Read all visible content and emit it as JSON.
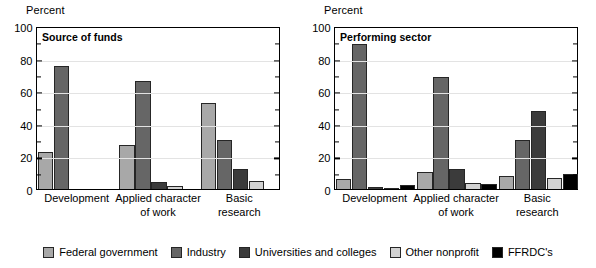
{
  "chart_data": [
    {
      "type": "bar",
      "title": "Source of funds",
      "ylabel": "Percent",
      "xlabel": "",
      "ylim": [
        0,
        100
      ],
      "yticks": [
        0,
        20,
        40,
        60,
        80,
        100
      ],
      "grid": true,
      "legend_position": "bottom",
      "categories": [
        "Development",
        "Applied character\nof work",
        "Basic\nresearch"
      ],
      "series": [
        {
          "name": "Federal government",
          "color": "#a8a8a8",
          "values": [
            23,
            27,
            53
          ]
        },
        {
          "name": "Industry",
          "color": "#666666",
          "values": [
            75.5,
            66,
            30
          ]
        },
        {
          "name": "Universities and colleges",
          "color": "#3b3b3b",
          "values": [
            0,
            4,
            12
          ]
        },
        {
          "name": "Other nonprofit",
          "color": "#d2d2d2",
          "values": [
            0,
            2,
            5
          ]
        },
        {
          "name": "FFRDC's",
          "color": "#000000",
          "values": [
            0,
            0,
            0
          ]
        }
      ]
    },
    {
      "type": "bar",
      "title": "Performing sector",
      "ylabel": "Percent",
      "xlabel": "",
      "ylim": [
        0,
        100
      ],
      "yticks": [
        0,
        20,
        40,
        60,
        80,
        100
      ],
      "grid": true,
      "legend_position": "bottom",
      "categories": [
        "Development",
        "Applied character\nof work",
        "Basic\nresearch"
      ],
      "series": [
        {
          "name": "Federal government",
          "color": "#a8a8a8",
          "values": [
            6,
            10.5,
            8
          ]
        },
        {
          "name": "Industry",
          "color": "#666666",
          "values": [
            89,
            69,
            30
          ]
        },
        {
          "name": "Universities and colleges",
          "color": "#3b3b3b",
          "values": [
            1,
            12,
            48
          ]
        },
        {
          "name": "Other nonprofit",
          "color": "#d2d2d2",
          "values": [
            0.4,
            3.5,
            7
          ]
        },
        {
          "name": "FFRDC's",
          "color": "#000000",
          "values": [
            2.5,
            3,
            9.5
          ]
        }
      ]
    }
  ],
  "legend": {
    "items": [
      {
        "label": "Federal government",
        "color": "#a8a8a8"
      },
      {
        "label": "Industry",
        "color": "#666666"
      },
      {
        "label": "Universities and colleges",
        "color": "#3b3b3b"
      },
      {
        "label": "Other nonprofit",
        "color": "#d2d2d2"
      },
      {
        "label": "FFRDC's",
        "color": "#000000"
      }
    ]
  }
}
